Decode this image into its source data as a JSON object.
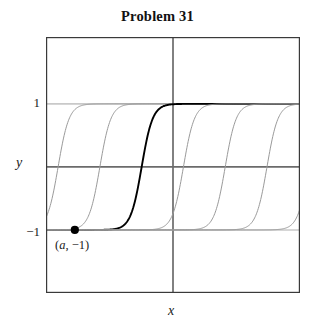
{
  "title": "Problem 31",
  "axes": {
    "x_label": "x",
    "y_label": "y",
    "ytick_pos1": "1",
    "ytick_neg1": "−1"
  },
  "annotation": {
    "open_paren": "(",
    "point_var": "a",
    "separator": ", ",
    "point_value": "−1",
    "close_paren": ")"
  },
  "colors": {
    "frame": "#3a3a3a",
    "axis": "#6b6b6b",
    "gridline": "#c9c9c9",
    "solution_curve": "#9a9a9a",
    "highlighted_curve": "#000000",
    "point": "#000000",
    "text": "#1a1a1a",
    "background": "#ffffff"
  },
  "chart_data": {
    "type": "line",
    "title": "Problem 31",
    "xlabel": "x",
    "ylabel": "y",
    "xlim": [
      -3.04,
      3.04
    ],
    "ylim": [
      -2.0,
      2.06
    ],
    "grid": true,
    "gridlines_y": [
      -1,
      1
    ],
    "legend": null,
    "xtick_labels": [],
    "ytick_labels": [
      "1",
      "-1"
    ],
    "ytick_values": [
      1,
      -1
    ],
    "equilibria": [
      -1,
      1
    ],
    "curve_period": 1.0,
    "series": [
      {
        "name": "solution-curve-1",
        "style": "thin-gray",
        "shift": -2.75,
        "x": [
          -3.04,
          -2.9,
          -2.75,
          -2.6,
          -2.45,
          -2.3,
          -2.15,
          -2.0,
          -1.85
        ],
        "y": [
          -0.92,
          -0.72,
          -0.28,
          0.25,
          0.66,
          0.86,
          0.95,
          0.985,
          1.0
        ]
      },
      {
        "name": "solution-curve-2",
        "style": "thin-gray",
        "shift": -1.75,
        "x": [
          -2.55,
          -2.3,
          -2.05,
          -1.9,
          -1.75,
          -1.6,
          -1.45,
          -1.3,
          -1.05
        ],
        "y": [
          -1.0,
          -0.97,
          -0.8,
          -0.55,
          -0.28,
          0.05,
          0.4,
          0.68,
          0.95
        ]
      },
      {
        "name": "solution-curve-3-highlighted",
        "style": "bold-black",
        "shift": -0.75,
        "x": [
          -3.04,
          -2.2,
          -1.6,
          -1.25,
          -1.0,
          -0.85,
          -0.75,
          -0.6,
          -0.4,
          -0.2,
          0.0
        ],
        "y": [
          -1.0,
          -1.0,
          -0.99,
          -0.93,
          -0.8,
          -0.55,
          -0.28,
          0.18,
          0.62,
          0.88,
          1.0
        ]
      },
      {
        "name": "solution-curve-4",
        "style": "thin-gray",
        "shift": 0.25,
        "x": [
          -0.85,
          -0.55,
          -0.3,
          -0.1,
          0.05,
          0.25,
          0.45,
          0.65,
          0.9
        ],
        "y": [
          -1.0,
          -0.98,
          -0.9,
          -0.72,
          -0.5,
          -0.1,
          0.38,
          0.7,
          0.95
        ]
      },
      {
        "name": "solution-curve-5",
        "style": "thin-gray",
        "shift": 1.25,
        "x": [
          0.15,
          0.45,
          0.7,
          0.9,
          1.05,
          1.25,
          1.45,
          1.65,
          1.9
        ],
        "y": [
          -1.0,
          -0.98,
          -0.9,
          -0.72,
          -0.5,
          -0.1,
          0.38,
          0.7,
          0.95
        ]
      },
      {
        "name": "solution-curve-6",
        "style": "thin-gray",
        "shift": 2.25,
        "x": [
          1.15,
          1.45,
          1.7,
          1.9,
          2.05,
          2.25,
          2.45,
          2.65,
          2.9
        ],
        "y": [
          -1.0,
          -0.98,
          -0.9,
          -0.72,
          -0.5,
          -0.1,
          0.38,
          0.7,
          0.95
        ]
      },
      {
        "name": "solution-curve-7",
        "style": "thin-gray",
        "shift": 3.25,
        "x": [
          2.15,
          2.45,
          2.7,
          2.9,
          3.04
        ],
        "y": [
          -1.0,
          -0.98,
          -0.9,
          -0.72,
          -0.52
        ]
      }
    ],
    "points": [
      {
        "name": "initial-condition-point",
        "label": "(a, -1)",
        "x": -2.35,
        "y": -1,
        "marker": "filled-circle"
      }
    ]
  }
}
